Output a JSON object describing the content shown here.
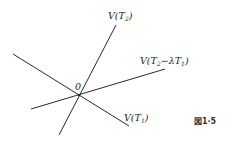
{
  "diagram": {
    "origin_label": "0",
    "lines": [
      {
        "name": "V(T2)",
        "label_main": "V(",
        "label_var": "T",
        "label_sub": "2",
        "label_tail": ")"
      },
      {
        "name": "V(T2-λT1)",
        "label_main": "V(",
        "label_var": "T",
        "label_sub": "2",
        "label_mid": "−λT",
        "label_sub2": "1",
        "label_tail": ")"
      },
      {
        "name": "V(T1)",
        "label_main": "V(",
        "label_var": "T",
        "label_sub": "1",
        "label_tail": ")"
      }
    ],
    "figure_caption": "図1·5"
  }
}
